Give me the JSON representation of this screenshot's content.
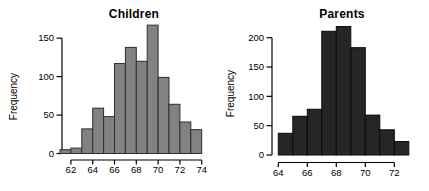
{
  "figure": {
    "background": "#ffffff",
    "text_color": "#000000"
  },
  "chart_data": [
    {
      "type": "bar",
      "subtype": "histogram",
      "title": "Children",
      "xlabel": "",
      "ylabel": "Frequency",
      "bin_start": 61,
      "bin_width": 1,
      "bin_edges": [
        61,
        62,
        63,
        64,
        65,
        66,
        67,
        68,
        69,
        70,
        71,
        72,
        73,
        74
      ],
      "counts": [
        5,
        7,
        32,
        59,
        48,
        117,
        138,
        120,
        167,
        99,
        64,
        41,
        31
      ],
      "x_ticks": [
        62,
        64,
        66,
        68,
        70,
        72,
        74
      ],
      "y_ticks": [
        0,
        50,
        100,
        150
      ],
      "xlim": [
        61,
        74
      ],
      "ylim": [
        0,
        170
      ],
      "grid": "off",
      "bar_fill": "#828282",
      "bar_border": "#2e2e2e",
      "axis_color": "#000000"
    },
    {
      "type": "bar",
      "subtype": "histogram",
      "title": "Parents",
      "xlabel": "",
      "ylabel": "Frequency",
      "bin_start": 64,
      "bin_width": 1,
      "bin_edges": [
        64,
        65,
        66,
        67,
        68,
        69,
        70,
        71,
        72,
        73
      ],
      "counts": [
        37,
        66,
        78,
        211,
        219,
        183,
        68,
        43,
        23
      ],
      "x_ticks": [
        64,
        66,
        68,
        70,
        72
      ],
      "y_ticks": [
        0,
        50,
        100,
        150,
        200
      ],
      "xlim": [
        64,
        73
      ],
      "ylim": [
        0,
        220
      ],
      "grid": "off",
      "bar_fill": "#262626",
      "bar_border": "#0a0a0a",
      "axis_color": "#000000"
    }
  ]
}
